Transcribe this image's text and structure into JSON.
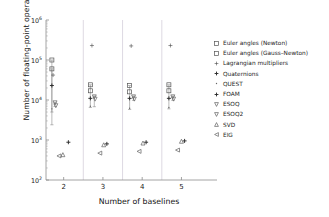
{
  "chart_data": {
    "type": "scatter",
    "title": "",
    "xlabel": "Number of baselines",
    "ylabel": "Number of floating-point operations",
    "xtick_labels": [
      "2",
      "3",
      "4",
      "5"
    ],
    "x": [
      2,
      3,
      4,
      5
    ],
    "ytick_labels": [
      "10^2",
      "10^3",
      "10^4",
      "10^5",
      "10^6"
    ],
    "ytick_mantissa": [
      "10",
      "10",
      "10",
      "10",
      "10"
    ],
    "ytick_exponent": [
      "2",
      "3",
      "4",
      "5",
      "6"
    ],
    "ylim": [
      100,
      1000000
    ],
    "xlim": [
      1.55,
      5.6
    ],
    "yscale": "log",
    "xscale": "linear",
    "grid": false,
    "legend_position": "right",
    "series": [
      {
        "name": "Euler angles (Newton)",
        "marker": "square-open",
        "color": "#555555",
        "points": [
          {
            "x": 1.7,
            "y": 100000
          },
          {
            "x": 2.68,
            "y": 24000
          },
          {
            "x": 3.68,
            "y": 23000
          },
          {
            "x": 4.68,
            "y": 24000
          }
        ]
      },
      {
        "name": "Euler angles (Gauss-Newton)",
        "marker": "square-open",
        "color": "#555555",
        "points": [
          {
            "x": 1.7,
            "y": 60000
          },
          {
            "x": 2.68,
            "y": 17000
          },
          {
            "x": 3.68,
            "y": 16000
          },
          {
            "x": 4.68,
            "y": 17000
          }
        ]
      },
      {
        "name": "Lagrangian multipliers",
        "marker": "plus-thin",
        "color": "#4a4a4a",
        "points": [
          {
            "x": 1.73,
            "y": 42000
          },
          {
            "x": 2.72,
            "y": 230000
          },
          {
            "x": 3.72,
            "y": 225000
          },
          {
            "x": 4.72,
            "y": 230000
          }
        ]
      },
      {
        "name": "Quaternions",
        "marker": "plus",
        "color": "#2a2a2a",
        "points": [
          {
            "x": 1.7,
            "y": 23000
          },
          {
            "x": 2.68,
            "y": 11000
          },
          {
            "x": 3.68,
            "y": 11000
          },
          {
            "x": 4.68,
            "y": 11000
          }
        ]
      },
      {
        "name": "QUEST",
        "marker": "none",
        "color": "#666666",
        "points": [
          {
            "x": 1.7,
            "y": 6000
          },
          {
            "x": 2.68,
            "y": 7000
          },
          {
            "x": 3.68,
            "y": 6200
          },
          {
            "x": 4.68,
            "y": 6500
          }
        ]
      },
      {
        "name": "FOAM",
        "marker": "plus",
        "color": "#2a2a2a",
        "points": [
          {
            "x": 2.12,
            "y": 880
          },
          {
            "x": 3.1,
            "y": 800
          },
          {
            "x": 4.1,
            "y": 880
          },
          {
            "x": 5.08,
            "y": 950
          }
        ]
      },
      {
        "name": "ESOQ",
        "marker": "triangle-down-open",
        "color": "#606060",
        "points": [
          {
            "x": 1.78,
            "y": 8500
          },
          {
            "x": 2.78,
            "y": 12000
          },
          {
            "x": 3.78,
            "y": 12000
          },
          {
            "x": 4.78,
            "y": 12000
          }
        ]
      },
      {
        "name": "ESOQ2",
        "marker": "triangle-down-open",
        "color": "#606060",
        "points": [
          {
            "x": 1.8,
            "y": 7200
          },
          {
            "x": 2.8,
            "y": 10500
          },
          {
            "x": 3.8,
            "y": 10500
          },
          {
            "x": 4.8,
            "y": 10500
          }
        ]
      },
      {
        "name": "SVD",
        "marker": "triangle-up-open",
        "color": "#606060",
        "points": [
          {
            "x": 1.98,
            "y": 430
          },
          {
            "x": 3.02,
            "y": 760
          },
          {
            "x": 4.02,
            "y": 840
          },
          {
            "x": 5.0,
            "y": 930
          }
        ]
      },
      {
        "name": "EIG",
        "marker": "triangle-left-open",
        "color": "#606060",
        "points": [
          {
            "x": 1.88,
            "y": 400
          },
          {
            "x": 2.92,
            "y": 470
          },
          {
            "x": 3.92,
            "y": 520
          },
          {
            "x": 4.9,
            "y": 560
          }
        ]
      }
    ],
    "errorbars": [
      {
        "x": 1.7,
        "ylow": 2400,
        "yhigh": 100000
      },
      {
        "x": 1.7,
        "ylow": 5000,
        "yhigh": 60000
      },
      {
        "x": 1.78,
        "ylow": 6900,
        "yhigh": 8700
      },
      {
        "x": 2.68,
        "ylow": 6500,
        "yhigh": 24000
      },
      {
        "x": 2.78,
        "ylow": 6800,
        "yhigh": 12500
      },
      {
        "x": 3.68,
        "ylow": 5800,
        "yhigh": 23000
      },
      {
        "x": 3.78,
        "ylow": 9800,
        "yhigh": 12500
      },
      {
        "x": 4.68,
        "ylow": 6000,
        "yhigh": 24000
      },
      {
        "x": 4.78,
        "ylow": 9800,
        "yhigh": 12500
      }
    ],
    "separators": [
      2.5,
      3.5,
      4.5
    ]
  },
  "axes": {
    "xlabel": "Number of baselines",
    "ylabel": "Number of floating-point operations"
  },
  "legend": {
    "items": [
      {
        "label": "Euler angles (Newton)",
        "marker": "square-open-icon"
      },
      {
        "label": "Euler angles (Gauss–Newton)",
        "marker": "square-open-icon"
      },
      {
        "label": "Lagrangian multipliers",
        "marker": "plus-thin-icon"
      },
      {
        "label": "Quaternions",
        "marker": "plus-icon"
      },
      {
        "label": "QUEST",
        "marker": "none-icon"
      },
      {
        "label": "FOAM",
        "marker": "plus-icon"
      },
      {
        "label": "ESOQ",
        "marker": "triangle-down-open-icon"
      },
      {
        "label": "ESOQ2",
        "marker": "triangle-down-open-icon"
      },
      {
        "label": "SVD",
        "marker": "triangle-up-open-icon"
      },
      {
        "label": "EIG",
        "marker": "triangle-left-open-icon"
      }
    ]
  }
}
